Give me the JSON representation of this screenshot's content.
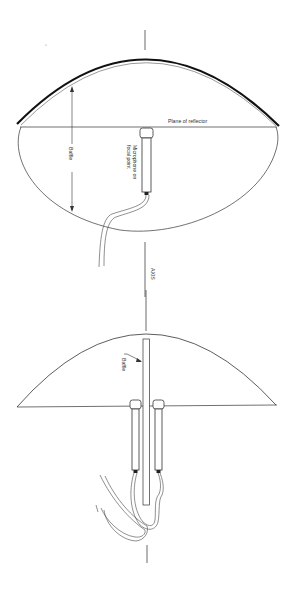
{
  "figure": {
    "type": "technical-diagram",
    "colors": {
      "line": "#2a2a2a",
      "background": "#ffffff"
    }
  },
  "top_view": {
    "labels": {
      "plane": "Plane of reflector",
      "baffle": "Baffle",
      "mic_line1": "Microphone on",
      "mic_line2": "focal point"
    }
  },
  "axis": {
    "label": "AXIS"
  },
  "bottom_view": {
    "labels": {
      "baffle": "Baffle"
    }
  }
}
